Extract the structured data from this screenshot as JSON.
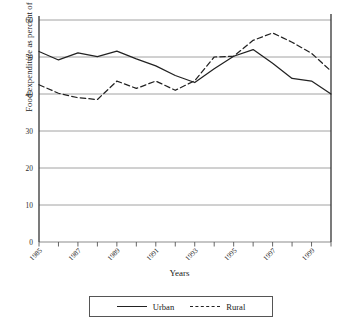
{
  "chart_data": {
    "type": "line",
    "title": "",
    "xlabel": "Years",
    "ylabel": "Food expenditure as percent of income",
    "ylim": [
      0,
      60
    ],
    "ytick_values": [
      0,
      10,
      20,
      30,
      40,
      50,
      60
    ],
    "ytick_labels": [
      "0",
      "10",
      "20",
      "30",
      "40",
      "50",
      "60"
    ],
    "xlim": [
      1985,
      2000
    ],
    "xtick_values": [
      1985,
      1986,
      1987,
      1988,
      1989,
      1990,
      1991,
      1992,
      1993,
      1994,
      1995,
      1996,
      1997,
      1998,
      1999,
      2000
    ],
    "xtick_labels": [
      "1985",
      "",
      "1987",
      "",
      "1989",
      "",
      "1991",
      "",
      "1993",
      "",
      "1995",
      "",
      "1997",
      "",
      "1999",
      ""
    ],
    "grid": "horizontal",
    "legend_position": "below-center",
    "x": [
      1985,
      1986,
      1987,
      1988,
      1989,
      1990,
      1991,
      1992,
      1993,
      1994,
      1995,
      1996,
      1997,
      1998,
      1999,
      2000
    ],
    "series": [
      {
        "name": "Urban",
        "style": "solid",
        "color": "#222222",
        "values": [
          51.5,
          49.2,
          51.1,
          50.1,
          51.6,
          49.5,
          47.6,
          45.0,
          43.1,
          46.8,
          50.2,
          52.0,
          48.3,
          44.2,
          43.5,
          40.0
        ]
      },
      {
        "name": "Rural",
        "style": "dashed",
        "color": "#222222",
        "values": [
          42.5,
          40.2,
          39.0,
          38.5,
          43.5,
          41.5,
          43.5,
          41.0,
          43.6,
          50.0,
          50.2,
          54.5,
          56.5,
          54.0,
          51.0,
          46.2
        ]
      }
    ]
  },
  "legend": {
    "entries": [
      {
        "label": "Urban",
        "style": "solid"
      },
      {
        "label": "Rural",
        "style": "dashed"
      }
    ]
  },
  "axis_titles": {
    "x": "Years",
    "y": "Food expenditure as percent of income"
  }
}
